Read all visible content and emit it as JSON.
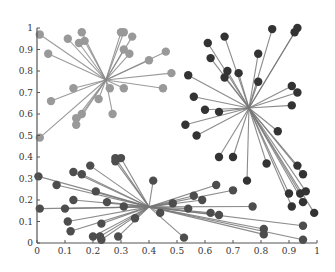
{
  "chart_data": {
    "type": "scatter",
    "title": "",
    "xlabel": "",
    "ylabel": "",
    "xlim": [
      0,
      1
    ],
    "ylim": [
      0,
      1
    ],
    "grid": false,
    "legend": "none",
    "x_ticks": [
      "0",
      "0.1",
      "0.2",
      "0.3",
      "0.4",
      "0.5",
      "0.6",
      "0.7",
      "0.8",
      "0.9",
      "1"
    ],
    "y_ticks": [
      "0",
      "0.1",
      "0.2",
      "0.3",
      "0.4",
      "0.5",
      "0.6",
      "0.7",
      "0.8",
      "0.9",
      "1"
    ],
    "x_tick_values": [
      0,
      0.1,
      0.2,
      0.3,
      0.4,
      0.5,
      0.6,
      0.7,
      0.8,
      0.9,
      1
    ],
    "y_tick_values": [
      0,
      0.1,
      0.2,
      0.3,
      0.4,
      0.5,
      0.6,
      0.7,
      0.8,
      0.9,
      1
    ],
    "series": [
      {
        "name": "cluster-upper-left",
        "color": "#999999",
        "line_color": "#8a8a8a",
        "center": [
          0.246,
          0.758
        ],
        "points": [
          [
            0.01,
            0.97
          ],
          [
            0.04,
            0.88
          ],
          [
            0.11,
            0.95
          ],
          [
            0.16,
            0.98
          ],
          [
            0.15,
            0.93
          ],
          [
            0.17,
            0.94
          ],
          [
            0.3,
            0.98
          ],
          [
            0.31,
            0.98
          ],
          [
            0.34,
            0.96
          ],
          [
            0.31,
            0.9
          ],
          [
            0.33,
            0.88
          ],
          [
            0.46,
            0.89
          ],
          [
            0.4,
            0.85
          ],
          [
            0.48,
            0.79
          ],
          [
            0.45,
            0.72
          ],
          [
            0.31,
            0.72
          ],
          [
            0.26,
            0.72
          ],
          [
            0.13,
            0.72
          ],
          [
            0.05,
            0.66
          ],
          [
            0.22,
            0.67
          ],
          [
            0.27,
            0.6
          ],
          [
            0.16,
            0.6
          ],
          [
            0.14,
            0.58
          ],
          [
            0.14,
            0.55
          ],
          [
            0.01,
            0.49
          ]
        ]
      },
      {
        "name": "cluster-upper-right",
        "color": "#333333",
        "line_color": "#777777",
        "center": [
          0.757,
          0.628
        ],
        "points": [
          [
            0.84,
            0.995
          ],
          [
            0.93,
            1.0
          ],
          [
            0.92,
            0.98
          ],
          [
            0.61,
            0.93
          ],
          [
            0.67,
            0.96
          ],
          [
            0.79,
            0.88
          ],
          [
            0.62,
            0.86
          ],
          [
            0.68,
            0.8
          ],
          [
            0.67,
            0.77
          ],
          [
            0.72,
            0.79
          ],
          [
            0.54,
            0.78
          ],
          [
            0.79,
            0.75
          ],
          [
            0.56,
            0.68
          ],
          [
            0.6,
            0.62
          ],
          [
            0.65,
            0.61
          ],
          [
            0.91,
            0.73
          ],
          [
            0.93,
            0.7
          ],
          [
            0.91,
            0.64
          ],
          [
            0.53,
            0.55
          ],
          [
            0.57,
            0.5
          ],
          [
            0.86,
            0.52
          ],
          [
            0.65,
            0.4
          ],
          [
            0.7,
            0.4
          ],
          [
            0.82,
            0.37
          ],
          [
            0.75,
            0.29
          ],
          [
            0.93,
            0.36
          ],
          [
            0.95,
            0.32
          ],
          [
            0.9,
            0.23
          ],
          [
            0.94,
            0.23
          ],
          [
            0.96,
            0.24
          ],
          [
            0.95,
            0.19
          ],
          [
            0.91,
            0.17
          ],
          [
            0.99,
            0.14
          ]
        ]
      },
      {
        "name": "cluster-lower",
        "color": "#4d4d4d",
        "line_color": "#777777",
        "center": [
          0.4,
          0.168
        ],
        "points": [
          [
            0.28,
            0.395
          ],
          [
            0.3,
            0.395
          ],
          [
            0.28,
            0.38
          ],
          [
            0.19,
            0.36
          ],
          [
            0.13,
            0.33
          ],
          [
            0.16,
            0.32
          ],
          [
            0.005,
            0.31
          ],
          [
            0.415,
            0.29
          ],
          [
            0.07,
            0.27
          ],
          [
            0.21,
            0.24
          ],
          [
            0.13,
            0.2
          ],
          [
            0.25,
            0.19
          ],
          [
            0.01,
            0.16
          ],
          [
            0.1,
            0.16
          ],
          [
            0.31,
            0.17
          ],
          [
            0.11,
            0.1
          ],
          [
            0.23,
            0.09
          ],
          [
            0.35,
            0.115
          ],
          [
            0.44,
            0.14
          ],
          [
            0.12,
            0.055
          ],
          [
            0.2,
            0.03
          ],
          [
            0.225,
            0.03
          ],
          [
            0.23,
            0.015
          ],
          [
            0.29,
            0.03
          ],
          [
            0.485,
            0.185
          ],
          [
            0.64,
            0.27
          ],
          [
            0.7,
            0.245
          ],
          [
            0.56,
            0.22
          ],
          [
            0.59,
            0.2
          ],
          [
            0.54,
            0.16
          ],
          [
            0.62,
            0.14
          ],
          [
            0.65,
            0.13
          ],
          [
            0.525,
            0.025
          ],
          [
            0.77,
            0.17
          ],
          [
            0.95,
            0.08
          ],
          [
            0.81,
            0.065
          ],
          [
            0.81,
            0.04
          ],
          [
            0.95,
            0.015
          ]
        ]
      }
    ]
  }
}
